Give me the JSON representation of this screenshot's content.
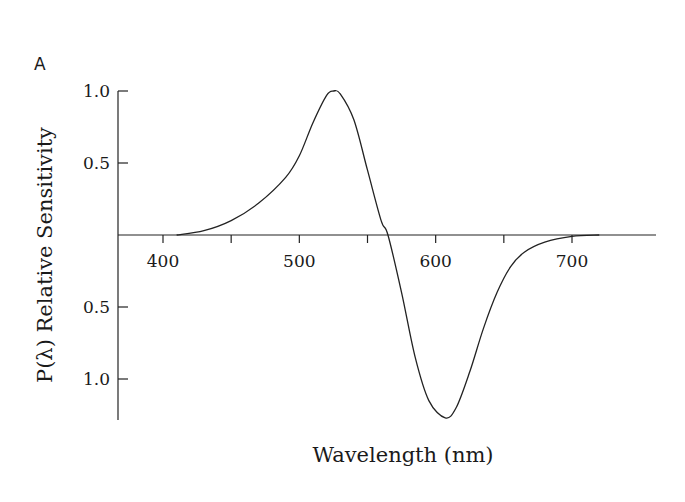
{
  "panel_label": "A",
  "chart_data": {
    "type": "line",
    "title": "",
    "xlabel": "Wavelength (nm)",
    "ylabel": "P(λ) Relative Sensitivity",
    "x_ticks": [
      400,
      450,
      500,
      550,
      600,
      650,
      700
    ],
    "x_tick_labels": [
      "400",
      "500",
      "600",
      "700"
    ],
    "y_tick_labels_positive": [
      "1.0",
      "0.5"
    ],
    "y_tick_labels_negative": [
      "0.5",
      "1.0"
    ],
    "xlim": [
      375,
      765
    ],
    "ylim": [
      -1.3,
      1.0
    ],
    "grid": false,
    "series": [
      {
        "name": "P(λ)",
        "x": [
          410,
          430,
          450,
          470,
          490,
          500,
          510,
          520,
          525,
          530,
          540,
          550,
          560,
          565,
          575,
          585,
          595,
          607,
          615,
          625,
          635,
          645,
          655,
          665,
          680,
          700,
          720
        ],
        "values": [
          0.0,
          0.03,
          0.1,
          0.22,
          0.4,
          0.55,
          0.78,
          0.97,
          1.0,
          0.98,
          0.8,
          0.45,
          0.1,
          0.0,
          -0.4,
          -0.85,
          -1.15,
          -1.27,
          -1.2,
          -0.95,
          -0.65,
          -0.4,
          -0.22,
          -0.12,
          -0.05,
          -0.01,
          0.0
        ]
      }
    ]
  }
}
